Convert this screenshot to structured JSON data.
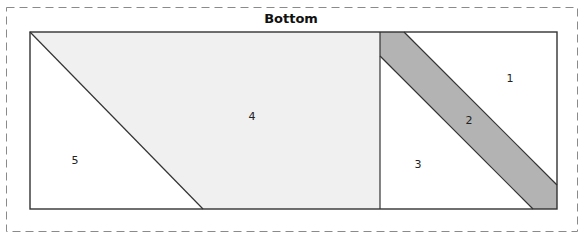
{
  "diagram": {
    "title": "Bottom",
    "colors": {
      "border_dash": "#888888",
      "outline": "#333333",
      "light_fill": "#f0f0f0",
      "dark_fill": "#b3b3b3",
      "white": "#ffffff"
    },
    "pieces": [
      {
        "id": "1",
        "label": "1",
        "fill": "white"
      },
      {
        "id": "2",
        "label": "2",
        "fill": "dark"
      },
      {
        "id": "3",
        "label": "3",
        "fill": "white"
      },
      {
        "id": "4",
        "label": "4",
        "fill": "light"
      },
      {
        "id": "5",
        "label": "5",
        "fill": "white"
      }
    ]
  }
}
